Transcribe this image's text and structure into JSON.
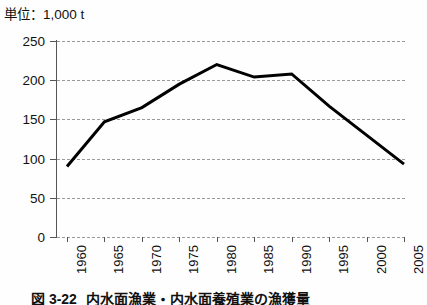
{
  "figure": {
    "unit_note": "単位：1,000 t",
    "caption_number": "図 3-22",
    "caption_text": "内水面漁業・内水面養殖業の漁獲量"
  },
  "chart_data": {
    "type": "line",
    "title": "",
    "subtitle": "",
    "xlabel": "",
    "ylabel": "",
    "unit": "1,000 t",
    "unit_note": "単位：1,000 t",
    "x": [
      1960,
      1965,
      1970,
      1975,
      1980,
      1985,
      1990,
      1995,
      2000,
      2005
    ],
    "categories": [
      "1960",
      "1965",
      "1970",
      "1975",
      "1980",
      "1985",
      "1990",
      "1995",
      "2000",
      "2005"
    ],
    "values": [
      90,
      147,
      165,
      195,
      220,
      204,
      208,
      167,
      130,
      93
    ],
    "series": [
      {
        "name": "内水面漁業・内水面養殖業の漁獲量",
        "values": [
          90,
          147,
          165,
          195,
          220,
          204,
          208,
          167,
          130,
          93
        ],
        "color": "#000000",
        "line_width": 3
      }
    ],
    "xlim": [
      1960,
      2005
    ],
    "ylim": [
      0,
      250
    ],
    "yticks": [
      0,
      50,
      100,
      150,
      200,
      250
    ],
    "ytick_labels": [
      "0",
      "50",
      "100",
      "150",
      "200",
      "250"
    ],
    "xticks": [
      1960,
      1965,
      1970,
      1975,
      1980,
      1985,
      1990,
      1995,
      2000,
      2005
    ],
    "xtick_labels": [
      "1960",
      "1965",
      "1970",
      "1975",
      "1980",
      "1985",
      "1990",
      "1995",
      "2000",
      "2005"
    ],
    "xtick_rotation": 90,
    "grid": true,
    "grid_axis": "y",
    "grid_style": "dashed",
    "grid_color": "#9a9a9a",
    "legend": false,
    "legend_position": "none",
    "markers": false,
    "axis_color": "#555555",
    "background_color": "#ffffff"
  }
}
